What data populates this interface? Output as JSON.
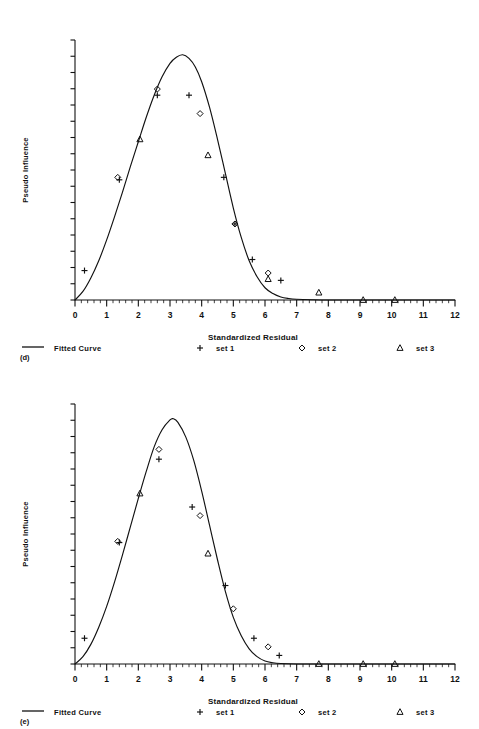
{
  "figures": [
    {
      "panel_label": "(d)",
      "y_axis_title": "Pseudo Influence",
      "x_axis_title": "Standardized Residual",
      "legend": {
        "fitted_curve_label": "Fitted Curve",
        "set1_label": "set 1",
        "set2_label": "set 2",
        "set3_label": "set 3",
        "set1_marker": "plus-marker",
        "set2_marker": "diamond-marker",
        "set3_marker": "triangle-marker",
        "curve_marker": "line-marker"
      },
      "chart_data": {
        "type": "scatter",
        "title": "",
        "xlabel": "Standardized Residual",
        "ylabel": "Pseudo Influence",
        "xlim": [
          0,
          12
        ],
        "ylim": [
          0,
          1.06
        ],
        "xticks": [
          "0",
          "1",
          "2",
          "3",
          "4",
          "5",
          "6",
          "7",
          "8",
          "9",
          "10",
          "11",
          "12"
        ],
        "yticks_labeled": false,
        "y_major_tick_count": 16,
        "x_minor_per_major": 5,
        "grid": false,
        "legend_position": "below-axis",
        "fitted_curve": {
          "name": "Fitted Curve",
          "points_x": [
            0.0,
            0.25,
            0.5,
            0.75,
            1.0,
            1.25,
            1.5,
            1.75,
            2.0,
            2.25,
            2.5,
            2.75,
            3.0,
            3.2,
            3.4,
            3.6,
            3.8,
            4.0,
            4.25,
            4.5,
            4.75,
            5.0,
            5.25,
            5.5,
            5.75,
            6.0,
            6.25,
            6.5,
            6.75,
            7.0,
            7.5,
            8.0,
            9.0,
            10.0,
            11.0,
            12.0
          ],
          "points_y": [
            0.0,
            0.035,
            0.09,
            0.16,
            0.245,
            0.34,
            0.44,
            0.545,
            0.645,
            0.745,
            0.835,
            0.91,
            0.965,
            0.99,
            1.0,
            0.985,
            0.95,
            0.89,
            0.785,
            0.655,
            0.515,
            0.375,
            0.255,
            0.16,
            0.095,
            0.05,
            0.026,
            0.012,
            0.006,
            0.003,
            0.001,
            0.0,
            0.0,
            0.0,
            0.0,
            0.0
          ]
        },
        "series": [
          {
            "name": "set 1",
            "marker": "plus",
            "x": [
              0.3,
              1.4,
              2.6,
              3.6,
              4.7,
              5.05,
              5.6,
              6.5
            ],
            "y": [
              0.12,
              0.49,
              0.835,
              0.835,
              0.5,
              0.31,
              0.165,
              0.08
            ]
          },
          {
            "name": "set 2",
            "marker": "diamond",
            "x": [
              1.35,
              2.6,
              3.95,
              5.05,
              6.1
            ],
            "y": [
              0.5,
              0.86,
              0.76,
              0.31,
              0.11
            ]
          },
          {
            "name": "set 3",
            "marker": "triangle",
            "x": [
              2.05,
              4.2,
              6.1,
              7.7,
              9.1,
              10.1
            ],
            "y": [
              0.655,
              0.59,
              0.085,
              0.03,
              0.0,
              0.0
            ]
          }
        ]
      }
    },
    {
      "panel_label": "(e)",
      "y_axis_title": "Pseudo Influence",
      "x_axis_title": "Standardized Residual",
      "legend": {
        "fitted_curve_label": "Fitted Curve",
        "set1_label": "set 1",
        "set2_label": "set 2",
        "set3_label": "set 3",
        "set1_marker": "plus-marker",
        "set2_marker": "diamond-marker",
        "set3_marker": "triangle-marker",
        "curve_marker": "line-marker"
      },
      "chart_data": {
        "type": "scatter",
        "title": "",
        "xlabel": "Standardized Residual",
        "ylabel": "Pseudo Influence",
        "xlim": [
          0,
          12
        ],
        "ylim": [
          0,
          1.06
        ],
        "xticks": [
          "0",
          "1",
          "2",
          "3",
          "4",
          "5",
          "6",
          "7",
          "8",
          "9",
          "10",
          "11",
          "12"
        ],
        "yticks_labeled": false,
        "y_major_tick_count": 16,
        "x_minor_per_major": 5,
        "grid": false,
        "legend_position": "below-axis",
        "fitted_curve": {
          "name": "Fitted Curve",
          "points_x": [
            0.0,
            0.25,
            0.5,
            0.75,
            1.0,
            1.25,
            1.5,
            1.75,
            2.0,
            2.25,
            2.5,
            2.75,
            3.0,
            3.1,
            3.25,
            3.5,
            3.75,
            4.0,
            4.25,
            4.5,
            4.75,
            5.0,
            5.25,
            5.5,
            5.75,
            6.0,
            6.25,
            6.5,
            7.0,
            7.5,
            8.0,
            9.0,
            10.0,
            11.0,
            12.0
          ],
          "points_y": [
            0.0,
            0.03,
            0.08,
            0.15,
            0.235,
            0.335,
            0.445,
            0.56,
            0.675,
            0.785,
            0.885,
            0.955,
            0.995,
            1.0,
            0.985,
            0.925,
            0.83,
            0.705,
            0.565,
            0.425,
            0.295,
            0.19,
            0.115,
            0.062,
            0.03,
            0.012,
            0.005,
            0.002,
            0.0,
            0.0,
            0.0,
            0.0,
            0.0,
            0.0,
            0.0
          ]
        },
        "series": [
          {
            "name": "set 1",
            "marker": "plus",
            "x": [
              0.3,
              1.4,
              2.65,
              3.7,
              4.75,
              5.65,
              6.45
            ],
            "y": [
              0.105,
              0.495,
              0.835,
              0.64,
              0.32,
              0.105,
              0.035
            ]
          },
          {
            "name": "set 2",
            "marker": "diamond",
            "x": [
              1.35,
              2.65,
              3.95,
              5.0,
              6.1
            ],
            "y": [
              0.5,
              0.875,
              0.605,
              0.225,
              0.07
            ]
          },
          {
            "name": "set 3",
            "marker": "triangle",
            "x": [
              2.05,
              4.2,
              7.7,
              9.1,
              10.1
            ],
            "y": [
              0.695,
              0.45,
              0.0,
              0.0,
              0.0
            ]
          }
        ]
      }
    }
  ]
}
